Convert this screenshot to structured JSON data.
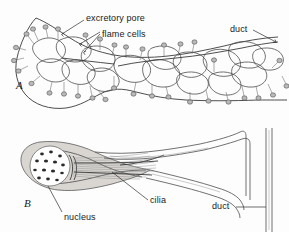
{
  "figure": {
    "kind": "scientific-illustration",
    "background_color": "#fdfdfd",
    "ink_color": "#4d4d4d",
    "label_color": "#1a1a1a"
  },
  "panels": [
    {
      "id": "A",
      "letter": "A",
      "caption": "whole excretory network in body",
      "labels": [
        {
          "id": "excretory-pore",
          "text": "excretory pore"
        },
        {
          "id": "flame-cells",
          "text": "flame cells"
        },
        {
          "id": "duct-a",
          "text": "duct"
        }
      ]
    },
    {
      "id": "B",
      "letter": "B",
      "caption": "single flame cell detail",
      "labels": [
        {
          "id": "nucleus",
          "text": "nucleus"
        },
        {
          "id": "cilia",
          "text": "cilia"
        },
        {
          "id": "duct-b",
          "text": "duct"
        }
      ]
    }
  ],
  "labels": {
    "excretory_pore": "excretory pore",
    "flame_cells": "flame cells",
    "duct_top": "duct",
    "nucleus": "nucleus",
    "cilia": "cilia",
    "duct_bottom": "duct",
    "panel_a": "A",
    "panel_b": "B"
  }
}
